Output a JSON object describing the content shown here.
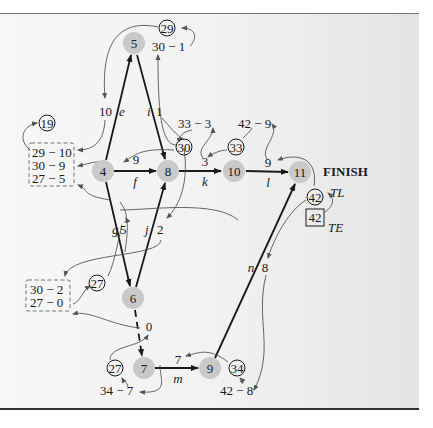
{
  "diagram": {
    "type": "PERT network with earliest/latest event times",
    "finish_label": "FINISH",
    "tl_label": "TL",
    "te_label": "TE",
    "colors": {
      "node_fill": "#c9c9c9",
      "edge": "#1a1a1a",
      "annotation": "#555555"
    },
    "nodes": [
      {
        "id": "5",
        "label": "5",
        "x": 134,
        "y": 43
      },
      {
        "id": "4",
        "label": "4",
        "x": 103,
        "y": 171
      },
      {
        "id": "8",
        "label": "8",
        "x": 168,
        "y": 171
      },
      {
        "id": "10",
        "label": "10",
        "x": 234,
        "y": 171
      },
      {
        "id": "11",
        "label": "11",
        "x": 300,
        "y": 172
      },
      {
        "id": "6",
        "label": "6",
        "x": 133,
        "y": 298
      },
      {
        "id": "7",
        "label": "7",
        "x": 144,
        "y": 368
      },
      {
        "id": "9",
        "label": "9",
        "x": 210,
        "y": 368
      }
    ],
    "activities": [
      {
        "from": "4",
        "to": "5",
        "name": "e",
        "duration": "10"
      },
      {
        "from": "5",
        "to": "8",
        "name": "i",
        "duration": "1"
      },
      {
        "from": "4",
        "to": "8",
        "name": "f",
        "duration": "9"
      },
      {
        "from": "8",
        "to": "10",
        "name": "k",
        "duration": "3"
      },
      {
        "from": "10",
        "to": "11",
        "name": "l",
        "duration": "9"
      },
      {
        "from": "4",
        "to": "6",
        "name": "g",
        "duration": "5"
      },
      {
        "from": "6",
        "to": "8",
        "name": "j",
        "duration": "2"
      },
      {
        "from": "6",
        "to": "7",
        "name": "dummy",
        "duration": "0"
      },
      {
        "from": "7",
        "to": "9",
        "name": "m",
        "duration": "7"
      },
      {
        "from": "9",
        "to": "11",
        "name": "n",
        "duration": "8"
      }
    ],
    "latest_times": [
      {
        "node": "5",
        "value": "29",
        "calc": "30 − 1"
      },
      {
        "node": "4",
        "value": "19",
        "calc_lines": [
          "29 − 10",
          "30 − 9",
          "27 − 5"
        ]
      },
      {
        "node": "8",
        "value": "30",
        "calc": "33 − 3"
      },
      {
        "node": "10",
        "value": "33",
        "calc": "42 − 9"
      },
      {
        "node": "6",
        "value": "27",
        "calc_lines": [
          "30 − 2",
          "27 − 0"
        ]
      },
      {
        "node": "7",
        "value": "27",
        "calc": "34 − 7"
      },
      {
        "node": "9",
        "value": "34",
        "calc": "42 − 8"
      },
      {
        "node": "11",
        "value": "42",
        "te_value": "42"
      }
    ]
  }
}
